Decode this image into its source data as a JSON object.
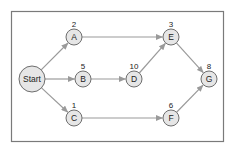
{
  "diagram": {
    "type": "network-graph",
    "colors": {
      "frame": "#7a7a7a",
      "node_fill": "#e6e6e6",
      "node_stroke": "#6e6e6e",
      "edge": "#9a9a9a",
      "text": "#222222"
    },
    "nodes": [
      {
        "id": "Start",
        "label": "Start",
        "value": "",
        "x": 32,
        "y": 79,
        "r": 13
      },
      {
        "id": "A",
        "label": "A",
        "value": "2",
        "x": 74,
        "y": 37,
        "r": 8
      },
      {
        "id": "B",
        "label": "B",
        "value": "5",
        "x": 83,
        "y": 79,
        "r": 8
      },
      {
        "id": "C",
        "label": "C",
        "value": "1",
        "x": 74,
        "y": 118,
        "r": 8
      },
      {
        "id": "D",
        "label": "D",
        "value": "10",
        "x": 134,
        "y": 79,
        "r": 8
      },
      {
        "id": "E",
        "label": "E",
        "value": "3",
        "x": 171,
        "y": 37,
        "r": 8
      },
      {
        "id": "F",
        "label": "F",
        "value": "6",
        "x": 171,
        "y": 118,
        "r": 8
      },
      {
        "id": "G",
        "label": "G",
        "value": "8",
        "x": 209,
        "y": 79,
        "r": 8
      }
    ],
    "edges": [
      {
        "from": "Start",
        "to": "A"
      },
      {
        "from": "Start",
        "to": "B"
      },
      {
        "from": "Start",
        "to": "C"
      },
      {
        "from": "A",
        "to": "E"
      },
      {
        "from": "B",
        "to": "D"
      },
      {
        "from": "D",
        "to": "E"
      },
      {
        "from": "C",
        "to": "F"
      },
      {
        "from": "E",
        "to": "G"
      },
      {
        "from": "F",
        "to": "G"
      }
    ]
  }
}
